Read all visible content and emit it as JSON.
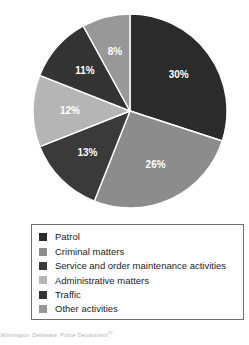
{
  "chart_data": {
    "type": "pie",
    "title": "",
    "subtitle": "",
    "xlabel": "",
    "ylabel": "",
    "legend_position": "bottom",
    "grid": false,
    "start_angle_deg": 0,
    "direction": "clockwise",
    "categories": [
      "Patrol",
      "Criminal matters",
      "Service and order maintenance activities",
      "Administrative matters",
      "Traffic",
      "Other activities"
    ],
    "values": [
      30,
      26,
      13,
      12,
      11,
      8
    ],
    "data_labels": [
      "30%",
      "26%",
      "13%",
      "12%",
      "11%",
      "8%"
    ],
    "colors": [
      "#2b2b2b",
      "#8c8c8c",
      "#3a3a3a",
      "#b5b5b5",
      "#333333",
      "#989898"
    ],
    "slices": [
      {
        "label": "Patrol",
        "value": 30,
        "data_label": "30%",
        "color": "#2b2b2b"
      },
      {
        "label": "Criminal matters",
        "value": 26,
        "data_label": "26%",
        "color": "#8c8c8c"
      },
      {
        "label": "Service and order maintenance activities",
        "value": 13,
        "data_label": "13%",
        "color": "#3a3a3a"
      },
      {
        "label": "Administrative matters",
        "value": 12,
        "data_label": "12%",
        "color": "#b5b5b5"
      },
      {
        "label": "Traffic",
        "value": 11,
        "data_label": "11%",
        "color": "#333333"
      },
      {
        "label": "Other activities",
        "value": 8,
        "data_label": "8%",
        "color": "#989898"
      }
    ]
  },
  "legend": {
    "items": [
      {
        "label": "Patrol",
        "color": "#2b2b2b"
      },
      {
        "label": "Criminal matters",
        "color": "#8c8c8c"
      },
      {
        "label": "Service and order maintenance activities",
        "color": "#3a3a3a"
      },
      {
        "label": "Administrative matters",
        "color": "#b5b5b5"
      },
      {
        "label": "Traffic",
        "color": "#333333"
      },
      {
        "label": "Other activities",
        "color": "#989898"
      }
    ]
  },
  "source": {
    "text": "e: Wilmington, Delaware, Police Department",
    "marker": "13"
  }
}
